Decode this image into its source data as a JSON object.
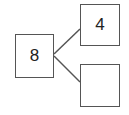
{
  "diagram": {
    "type": "number-bond",
    "whole": {
      "value": "8"
    },
    "parts": [
      {
        "value": "4"
      },
      {
        "value": ""
      }
    ],
    "line_color": "#555555",
    "border_color": "#555555"
  }
}
